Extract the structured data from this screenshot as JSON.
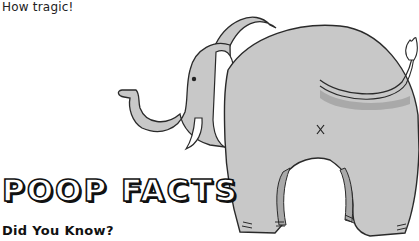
{
  "caption": "How tragic!",
  "title": "POOP FACTS",
  "subtitle": "Did You Know?",
  "illustration": {
    "subject": "elephant-rear-view",
    "icon": "elephant-illustration",
    "mark": "x",
    "colors": {
      "body": "#c8c8c8",
      "shade": "#a9a9a9",
      "outline": "#2a2a2a",
      "background": "#ffffff"
    }
  }
}
